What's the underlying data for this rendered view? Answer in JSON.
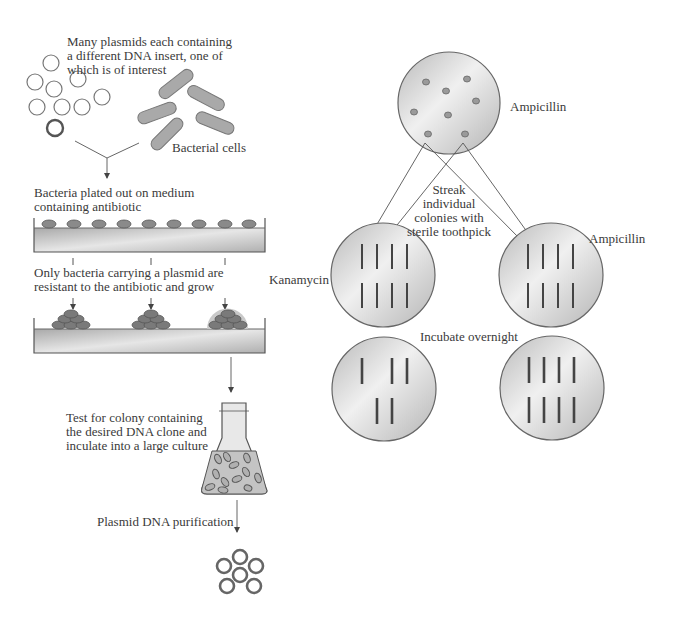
{
  "labels": {
    "plasmids": "Many plasmids each containing\na different DNA insert, one of\nwhich is of interest",
    "bacterial_cells": "Bacterial cells",
    "plated_out": "Bacteria plated out on medium\ncontaining antibiotic",
    "only_resistant": "Only bacteria carrying a plasmid are\nresistant to the antibiotic and grow",
    "test_colony": "Test for colony containing\nthe desired DNA clone and\ninculate into a large culture",
    "purification": "Plasmid DNA purification",
    "master_plate": "Ampicillin",
    "streak": "Streak\nindividual\ncolonies with\nsterile toothpick",
    "kanamycin_plate": "Kanamycin",
    "ampicillin_plate": "Ampicillin",
    "incubate": "Incubate overnight"
  },
  "colors": {
    "plate_fill_light": "#eeeeee",
    "plate_fill_dark": "#b8b8b8",
    "outline": "#666666",
    "colony": "#8c8c8c",
    "streak": "#444444",
    "halo": "#c9c9c9"
  },
  "plates": {
    "master": {
      "antibiotic": "Ampicillin",
      "colonies": 8
    },
    "kanamycin_before": {
      "streaks": 8
    },
    "ampicillin_before": {
      "streaks": 8
    },
    "kanamycin_after": {
      "streaks": 5
    },
    "ampicillin_after": {
      "streaks": 8
    }
  }
}
